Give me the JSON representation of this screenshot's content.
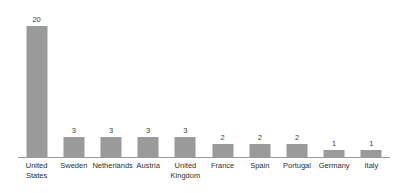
{
  "chart_data": {
    "type": "bar",
    "title": "",
    "subtitle": "",
    "xlabel": "",
    "ylabel": "",
    "categories": [
      "United States",
      "Sweden",
      "Netherlands",
      "Austria",
      "United Kingdom",
      "France",
      "Spain",
      "Portugal",
      "Germany",
      "Italy"
    ],
    "values": [
      20,
      3,
      3,
      3,
      3,
      2,
      2,
      2,
      1,
      1
    ],
    "data_labels": [
      "20",
      "3",
      "3",
      "3",
      "3",
      "2",
      "2",
      "2",
      "1",
      "1"
    ],
    "ylim": [
      0,
      20
    ],
    "grid": false,
    "legend": false,
    "legend_position": "none",
    "axis_visible": {
      "x_baseline": true,
      "y_axis": false,
      "x_ticks": false,
      "y_ticks": false
    },
    "colors": {
      "bar": "#9a9a9a",
      "background": "#ffffff",
      "axis_line": "#9b9b9b",
      "value_label": "#3c3c3c",
      "tick_label": "#2f2f2f"
    }
  }
}
